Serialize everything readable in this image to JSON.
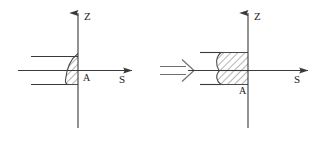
{
  "figure": {
    "title_visible": false,
    "background_color": "#ffffff",
    "stroke_color": "#3a3a3a",
    "hatch_color": "#4a4a4a",
    "panels": [
      {
        "id": "before",
        "role": "initial-state",
        "axes": {
          "vertical_label": "Z",
          "horizontal_label": "S",
          "origin_label": "A"
        },
        "region": {
          "shape": "crescent",
          "fill": "diagonal-hatch",
          "side": "left-of-vertical-axis"
        },
        "guide_lines": 2
      },
      {
        "id": "after",
        "role": "resulting-state",
        "axes": {
          "vertical_label": "Z",
          "horizontal_label": "S",
          "origin_label": "A"
        },
        "region": {
          "shape": "rectangle-with-curved-left-edge",
          "fill": "diagonal-hatch",
          "side": "left-of-vertical-axis"
        },
        "guide_lines": 2
      }
    ],
    "transform_arrow": {
      "glyph": "implies-double-arrow",
      "symbol": "⇒",
      "direction": "right"
    }
  }
}
